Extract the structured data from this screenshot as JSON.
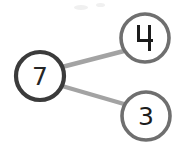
{
  "diagram": {
    "kind": "number-bond",
    "whole": {
      "value": "7",
      "cx": 40,
      "cy": 76,
      "r": 24,
      "stroke": "#3b3b3b",
      "stroke_width": 4.2
    },
    "parts": [
      {
        "value": "4",
        "cx": 145,
        "cy": 38,
        "r": 24,
        "stroke": "#6f6f6f",
        "stroke_width": 3.6,
        "glyph_style": "open-top"
      },
      {
        "value": "3",
        "cx": 146,
        "cy": 116,
        "r": 24,
        "stroke": "#6f6f6f",
        "stroke_width": 3.6,
        "glyph_style": "normal"
      }
    ],
    "connectors": [
      {
        "from": "7",
        "to": "4",
        "x1": 62,
        "y1": 67,
        "x2": 124,
        "y2": 51,
        "stroke": "#a3a3a3",
        "stroke_width": 4.4
      },
      {
        "from": "7",
        "to": "3",
        "x1": 62,
        "y1": 86,
        "x2": 124,
        "y2": 104,
        "stroke": "#a3a3a3",
        "stroke_width": 4.4
      }
    ],
    "background": "#ffffff"
  },
  "artifacts": [
    {
      "x": 74,
      "y": 5,
      "w": 14,
      "h": 5
    },
    {
      "x": 96,
      "y": 3,
      "w": 9,
      "h": 4
    }
  ]
}
